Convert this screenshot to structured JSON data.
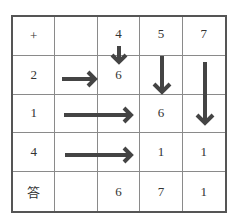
{
  "diagram": {
    "type": "addition-grid",
    "rows": [
      [
        "+",
        "",
        "4",
        "5",
        "7"
      ],
      [
        "2",
        "",
        "6",
        "",
        ""
      ],
      [
        "1",
        "",
        "",
        "6",
        ""
      ],
      [
        "4",
        "",
        "",
        "1",
        "1"
      ],
      [
        "答",
        "",
        "6",
        "7",
        "1"
      ]
    ],
    "arrow_color": "#444444",
    "arrows": [
      {
        "name": "arrow-down-col3-short",
        "direction": "down"
      },
      {
        "name": "arrow-down-col4",
        "direction": "down"
      },
      {
        "name": "arrow-down-col5-long",
        "direction": "down"
      },
      {
        "name": "arrow-right-row2-short",
        "direction": "right"
      },
      {
        "name": "arrow-right-row3-long",
        "direction": "right"
      },
      {
        "name": "arrow-right-row4-long",
        "direction": "right"
      }
    ]
  }
}
